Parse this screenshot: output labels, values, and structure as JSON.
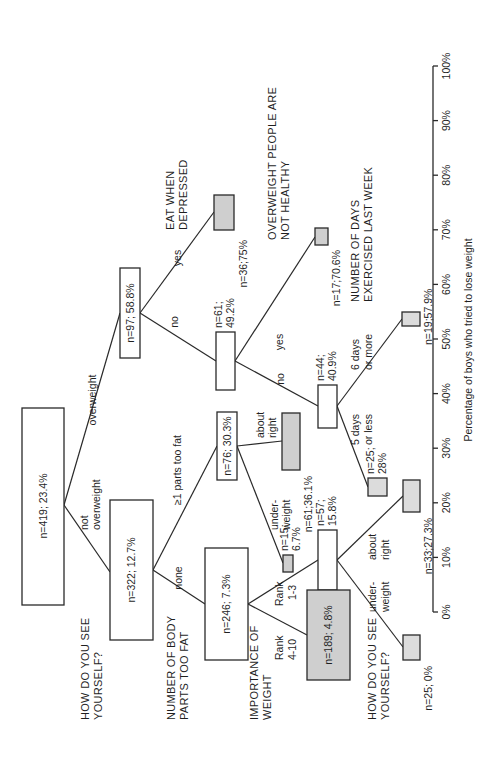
{
  "chart_data": {
    "type": "tree",
    "orientation": "rotated-90-ccw",
    "axis": {
      "label": "Percentage of boys who tried to lose weight",
      "ticks": [
        "0%",
        "10%",
        "20%",
        "30%",
        "40%",
        "50%",
        "60%",
        "70%",
        "80%",
        "90%",
        "100%"
      ],
      "range": [
        0,
        100
      ]
    },
    "questions": {
      "root": "HOW DO YOU SEE YOURSELF?",
      "eat_depressed": "EAT WHEN DEPRESSED",
      "body_parts": "NUMBER OF BODY PARTS TOO FAT",
      "overweight_healthy": "OVERWEIGHT PEOPLE ARE NOT HEALTHY",
      "importance": "IMPORTANCE OF WEIGHT",
      "exercise": "NUMBER OF DAYS EXERCISED LAST WEEK",
      "see_self_2": "HOW DO YOU SEE YOURSELF?"
    },
    "nodes": [
      {
        "id": "root",
        "n": 419,
        "pct": 23.4,
        "label": "n=419;  23.4%",
        "fill": "white"
      },
      {
        "id": "overweight",
        "n": 97,
        "pct": 58.8,
        "label": "n=97;  58.8%",
        "fill": "white"
      },
      {
        "id": "eat_yes",
        "n": 36,
        "pct": 75,
        "label": "n=36;75%",
        "fill": "gray"
      },
      {
        "id": "eat_no",
        "n": 61,
        "pct": 49.2,
        "label1": "n=61;",
        "label2": "49.2%",
        "fill": "white"
      },
      {
        "id": "healthy_yes",
        "n": 17,
        "pct": 70.6,
        "label": "n=17;70.6%",
        "fill": "gray"
      },
      {
        "id": "healthy_no",
        "n": 44,
        "pct": 40.9,
        "label1": "n=44;",
        "label2": "40.9%",
        "fill": "white"
      },
      {
        "id": "ex_6plus",
        "n": 19,
        "pct": 57.9,
        "label": "n=19;57.9%",
        "fill": "gray"
      },
      {
        "id": "ex_5less",
        "n": 25,
        "pct": 28,
        "label1": "n=25;",
        "label2": "28%",
        "fill": "gray"
      },
      {
        "id": "not_overweight",
        "n": 322,
        "pct": 12.7,
        "label": "n=322;  12.7%",
        "fill": "white"
      },
      {
        "id": "parts_1plus",
        "n": 76,
        "pct": 30.3,
        "label": "n=76;  30.3%",
        "fill": "white"
      },
      {
        "id": "parts_about_right",
        "n": 61,
        "pct": 36.1,
        "label": "n=61;36.1%",
        "fill": "gray"
      },
      {
        "id": "parts_underweight",
        "n": 15,
        "pct": 6.7,
        "label1": "n=15;",
        "label2": "6.7%",
        "fill": "gray"
      },
      {
        "id": "parts_none",
        "n": 246,
        "pct": 7.3,
        "label": "n=246;  7.3%",
        "fill": "white"
      },
      {
        "id": "rank_1_3",
        "n": 57,
        "pct": 15.8,
        "label1": "n=57;",
        "label2": "15.8%",
        "fill": "white"
      },
      {
        "id": "rank_4_10",
        "n": 189,
        "pct": 4.8,
        "label": "n=189;  4.8%",
        "fill": "gray"
      },
      {
        "id": "see_about_right",
        "n": 33,
        "pct": 27.3,
        "label": "n=33;27.3%",
        "fill": "gray"
      },
      {
        "id": "see_underweight",
        "n": 25,
        "pct": 0,
        "label": "n=25;  0%",
        "fill": "gray"
      }
    ],
    "edges": {
      "overweight": "overweight",
      "not_overweight_1": "not",
      "not_overweight_2": "overweight",
      "yes_eat": "yes",
      "no_eat": "no",
      "yes_healthy": "yes",
      "no_healthy": "no",
      "six_days_1": "6 days",
      "six_days_2": "or more",
      "five_days_1": "5 days",
      "five_days_2": "or less",
      "parts_1plus": "≥1 parts too fat",
      "none": "none",
      "about_right_1": "about",
      "about_right_2": "right",
      "under_1": "under-",
      "under_2": "weight",
      "rank13_1": "Rank",
      "rank13_2": "1-3",
      "rank410_1": "Rank",
      "rank410_2": "4-10",
      "about2_1": "about",
      "about2_2": "right",
      "under2_1": "under-",
      "under2_2": "weight"
    }
  }
}
